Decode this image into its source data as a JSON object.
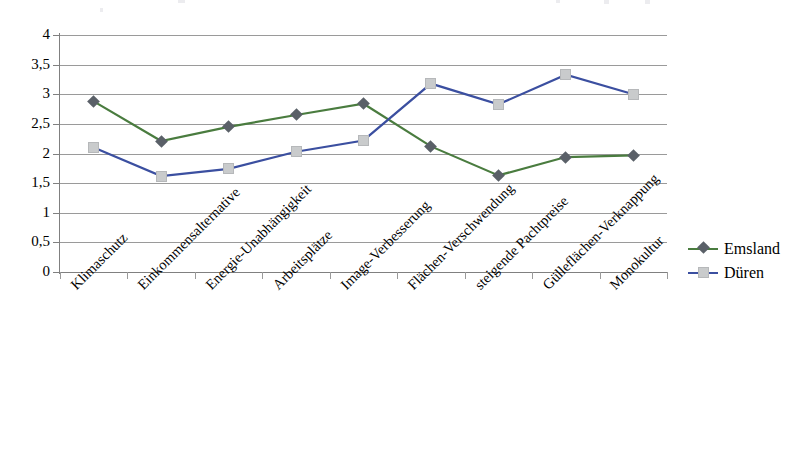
{
  "chart_data": {
    "type": "line",
    "title": "",
    "subtitle": "",
    "xlabel": "",
    "ylabel": "",
    "ylim": [
      0,
      4
    ],
    "ytick_labels": [
      "0",
      "0,5",
      "1",
      "1,5",
      "2",
      "2,5",
      "3",
      "3,5",
      "4"
    ],
    "ytick_values": [
      0,
      0.5,
      1,
      1.5,
      2,
      2.5,
      3,
      3.5,
      4
    ],
    "grid": true,
    "legend_position": "right",
    "categories": [
      "Klimaschutz",
      "Einkommensalternative",
      "Energie-Unabhängigkeit",
      "Arbeitsplätze",
      "Image-Verbesserung",
      "Flächen-Verschwendung",
      "steigende Pachtpreise",
      "Gülleflächen-Verknappung",
      "Monokultur"
    ],
    "series": [
      {
        "name": "Emsland",
        "color": "#4a7c3f",
        "marker": "diamond",
        "marker_color": "#5a6068",
        "values": [
          2.88,
          2.21,
          2.45,
          2.65,
          2.84,
          2.12,
          1.63,
          1.94,
          1.97
        ]
      },
      {
        "name": "Düren",
        "color": "#3b4fa0",
        "marker": "square",
        "marker_color": "#c9cbcc",
        "values": [
          2.1,
          1.62,
          1.74,
          2.03,
          2.22,
          3.18,
          2.83,
          3.33,
          3.0
        ]
      }
    ]
  },
  "legend": {
    "entries": [
      {
        "label": "Emsland"
      },
      {
        "label": "Düren"
      }
    ]
  },
  "colors": {
    "series_emsland": "#4a7c3f",
    "series_dueren": "#3b4fa0",
    "gridline": "#9a9a9a",
    "axis": "#808080",
    "marker_diamond": "#5a6068",
    "marker_square": "#c9cbcc"
  }
}
